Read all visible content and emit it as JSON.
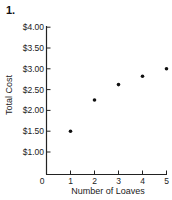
{
  "problem_number": "1.",
  "chart_data": {
    "type": "scatter",
    "title": "1.",
    "xlabel": "Number of Loaves",
    "ylabel": "Total Cost",
    "x": [
      1,
      2,
      3,
      4,
      5
    ],
    "values": [
      1.5,
      2.25,
      2.62,
      2.82,
      3.0
    ],
    "x_ticks": [
      "0",
      "1",
      "2",
      "3",
      "4",
      "5"
    ],
    "y_ticks": [
      "$1.00",
      "$1.50",
      "$2.00",
      "$2.50",
      "$3.00",
      "$3.50",
      "$4.00"
    ],
    "xlim": [
      0,
      5
    ],
    "ylim": [
      0.5,
      4.0
    ],
    "grid": false,
    "legend": null
  },
  "colors": {
    "point": "#111111",
    "axis": "#222222"
  }
}
